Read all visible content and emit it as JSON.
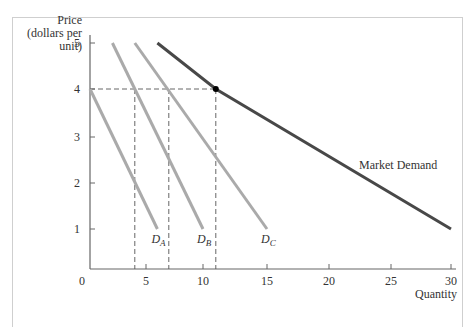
{
  "chart_data": {
    "type": "line",
    "title": "",
    "xlabel": "Quantity",
    "ylabel": "Price (dollars per unit)",
    "ylabel_lines": [
      "Price",
      "(dollars per",
      "unit)"
    ],
    "xlim": [
      0,
      30
    ],
    "ylim": [
      0,
      5
    ],
    "x_ticks": [
      0,
      5,
      10,
      15,
      20,
      25,
      30
    ],
    "y_ticks": [
      1,
      2,
      3,
      4,
      5
    ],
    "grid": false,
    "series": [
      {
        "name": "D_A",
        "label_main": "D",
        "label_sub": "A",
        "color": "#aaaaaa",
        "points": [
          [
            0,
            4
          ],
          [
            6,
            1
          ]
        ]
      },
      {
        "name": "D_B",
        "label_main": "D",
        "label_sub": "B",
        "color": "#aaaaaa",
        "points": [
          [
            2,
            5
          ],
          [
            10,
            1
          ]
        ]
      },
      {
        "name": "D_C",
        "label_main": "D",
        "label_sub": "C",
        "color": "#aaaaaa",
        "points": [
          [
            4,
            5
          ],
          [
            15,
            1
          ]
        ]
      },
      {
        "name": "Market Demand",
        "color": "#484848",
        "points": [
          [
            6,
            5
          ],
          [
            11,
            4
          ],
          [
            30,
            1
          ]
        ]
      }
    ],
    "annotations": {
      "reference_price": 4,
      "reference_quantities": [
        4,
        7,
        11
      ],
      "marked_point": [
        11,
        4
      ],
      "market_label": "Market Demand"
    }
  }
}
